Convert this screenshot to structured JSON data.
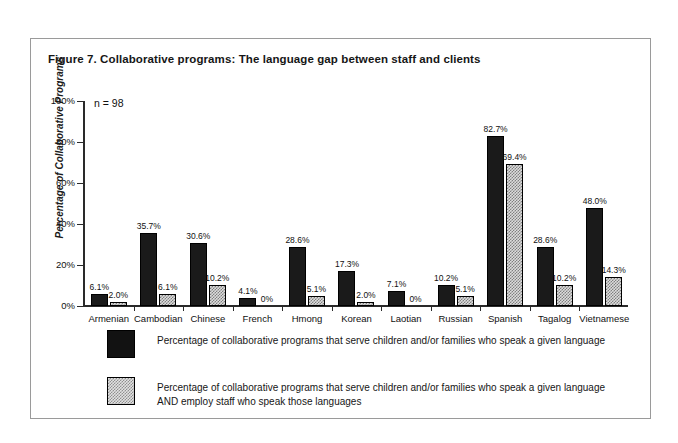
{
  "figure": {
    "title": "Figure 7. Collaborative programs: The language gap between staff and clients",
    "sample_note": "n = 98"
  },
  "chart_data": {
    "type": "bar",
    "title": "Figure 7. Collaborative programs: The language gap between staff and clients",
    "xlabel": "",
    "ylabel": "Percentage of Collaborative Programs",
    "ylim": [
      0,
      100
    ],
    "yticks": [
      "0%",
      "20%",
      "40%",
      "60%",
      "80%",
      "100%"
    ],
    "ytick_values": [
      0,
      20,
      40,
      60,
      80,
      100
    ],
    "grid": false,
    "legend_position": "below",
    "annotation": "n = 98",
    "categories": [
      "Armenian",
      "Cambodian",
      "Chinese",
      "French",
      "Hmong",
      "Korean",
      "Laotian",
      "Russian",
      "Spanish",
      "Tagalog",
      "Vietnamese"
    ],
    "series": [
      {
        "name": "Percentage of collaborative programs that serve children and/or families who speak a given language",
        "fill": "solid-black",
        "color": "#1a1a1a",
        "values": [
          6.1,
          35.7,
          30.6,
          4.1,
          28.6,
          17.3,
          7.1,
          10.2,
          82.7,
          28.6,
          48.0
        ],
        "labels": [
          "6.1%",
          "35.7%",
          "30.6%",
          "4.1%",
          "28.6%",
          "17.3%",
          "7.1%",
          "10.2%",
          "82.7%",
          "28.6%",
          "48.0%"
        ]
      },
      {
        "name": "Percentage of collaborative programs that serve children and/or families who speak a given language AND employ staff who speak those languages",
        "fill": "gray-checker",
        "color": "#dcdcdc",
        "values": [
          2.0,
          6.1,
          10.2,
          0,
          5.1,
          2.0,
          0,
          5.1,
          69.4,
          10.2,
          14.3
        ],
        "labels": [
          "2.0%",
          "6.1%",
          "10.2%",
          "0%",
          "5.1%",
          "2.0%",
          "0%",
          "5.1%",
          "69.4%",
          "10.2%",
          "14.3%"
        ]
      }
    ]
  },
  "legend": {
    "entries": [
      {
        "swatch": "solid-black",
        "line1": "Percentage of collaborative programs that serve children and/or families who speak a given language",
        "line2": ""
      },
      {
        "swatch": "gray-checker",
        "line1": "Percentage of collaborative programs that serve children and/or families who speak a given language",
        "line2": "AND employ staff who speak those languages"
      }
    ]
  }
}
